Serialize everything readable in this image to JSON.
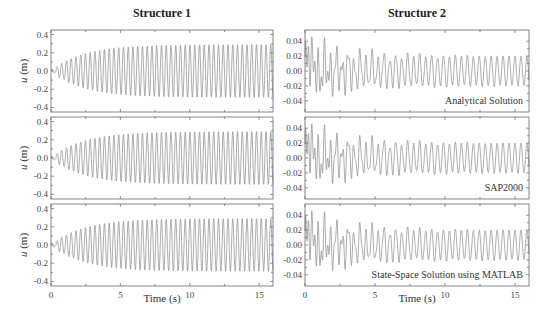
{
  "chart_data": [
    {
      "type": "line",
      "column": "Structure 1",
      "title": "Structure 1",
      "xlabel": "Time (s)",
      "ylabel": "u (m)",
      "xlim": [
        0,
        16
      ],
      "ylim": [
        -0.45,
        0.45
      ],
      "xticks": [
        0,
        5,
        10,
        15
      ],
      "yticks": [
        "0.4",
        "0.2",
        "0.0",
        "-0.2",
        "-0.4"
      ],
      "panels": [
        {
          "annotation": "",
          "method": "Analytical Solution",
          "description": "Harmonic response growing from 0 to steady amplitude ~0.29 m at ~2.9 Hz",
          "steady_amplitude": 0.29,
          "frequency_hz": 2.9
        },
        {
          "annotation": "",
          "method": "SAP2000",
          "description": "Harmonic response growing from 0 to steady amplitude ~0.29 m at ~2.9 Hz",
          "steady_amplitude": 0.29,
          "frequency_hz": 2.9
        },
        {
          "annotation": "",
          "method": "State-Space Solution using MATLAB",
          "description": "Harmonic response growing from 0 to steady amplitude ~0.29 m at ~2.9 Hz",
          "steady_amplitude": 0.29,
          "frequency_hz": 2.9
        }
      ]
    },
    {
      "type": "line",
      "column": "Structure 2",
      "title": "Structure 2",
      "xlabel": "Time (s)",
      "ylabel": "",
      "xlim": [
        0,
        16
      ],
      "ylim": [
        -0.055,
        0.055
      ],
      "xticks": [
        0,
        5,
        10,
        15
      ],
      "yticks": [
        "0.04",
        "0.02",
        "0.00",
        "-0.02",
        "-0.04"
      ],
      "panels": [
        {
          "annotation": "Analytical Solution",
          "description": "Beating response, initial peak ~0.047 m, decaying to steady amplitude ~0.02 m",
          "peak": 0.047,
          "steady_amplitude": 0.02
        },
        {
          "annotation": "SAP2000",
          "description": "Beating response, initial peak ~0.047 m, decaying to steady amplitude ~0.02 m",
          "peak": 0.047,
          "steady_amplitude": 0.02
        },
        {
          "annotation": "State-Space Solution using MATLAB",
          "description": "Beating response, initial peak ~0.047 m, decaying to steady amplitude ~0.02 m",
          "peak": 0.047,
          "steady_amplitude": 0.02
        }
      ]
    }
  ],
  "labels": {
    "title_left": "Structure 1",
    "title_right": "Structure 2",
    "xlabel": "Time (s)",
    "ylabel_italic": "u",
    "ylabel_unit": " (m)",
    "ann1": "Analytical Solution",
    "ann2": "SAP2000",
    "ann3": "State-Space Solution using MATLAB"
  }
}
